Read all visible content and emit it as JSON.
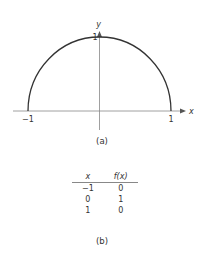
{
  "chart_data": {
    "type": "line",
    "title": "",
    "xlabel": "x",
    "ylabel": "y",
    "xlim": [
      -1.2,
      1.2
    ],
    "ylim": [
      0,
      1.05
    ],
    "x_ticks": [
      {
        "value": -1,
        "label": "−1"
      },
      {
        "value": 1,
        "label": "1"
      }
    ],
    "y_ticks": [
      {
        "value": 1,
        "label": "1"
      }
    ],
    "series": [
      {
        "name": "f(x) = sqrt(1 - x^2)",
        "function": "semicircle",
        "domain": [
          -1,
          1
        ]
      }
    ],
    "caption": "(a)",
    "grid": false
  },
  "table": {
    "headers": [
      "x",
      "f(x)"
    ],
    "rows": [
      [
        "−1",
        "0"
      ],
      [
        "0",
        "1"
      ],
      [
        "1",
        "0"
      ]
    ],
    "caption": "(b)"
  },
  "colors": {
    "curve": "#333333",
    "axis": "#888888"
  }
}
